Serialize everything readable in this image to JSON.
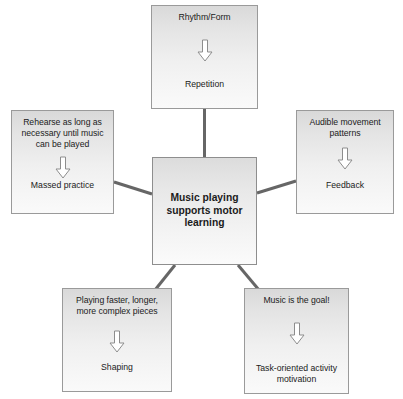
{
  "diagram": {
    "title": "Music playing supports motor learning",
    "center": {
      "label": "Music playing supports motor learning",
      "line1": "Music playing",
      "line2": "supports motor",
      "line3": "learning"
    },
    "arrow_icon": "down-arrow-icon",
    "line_color": "#666666",
    "box_border_color": "#9a9a9a",
    "box_fill_top": "#d9d9d9",
    "box_fill_bottom": "#fafafa",
    "text_color": "#1b1b1b",
    "background": "#ffffff",
    "nodes": [
      {
        "id": "top",
        "title": "Rhythm/Form",
        "result": "Repetition",
        "position": "top"
      },
      {
        "id": "left",
        "title": "Rehearse as long as necessary until music can be played",
        "result": "Massed practice",
        "position": "left"
      },
      {
        "id": "right",
        "title": "Audible movement patterns",
        "result": "Feedback",
        "position": "right"
      },
      {
        "id": "bottom-left",
        "title": "Playing faster, longer, more complex pieces",
        "result": "Shaping",
        "position": "bottom-left"
      },
      {
        "id": "bottom-right",
        "title": "Music is the goal!",
        "result": "Task-oriented activity motivation",
        "position": "bottom-right"
      }
    ]
  }
}
